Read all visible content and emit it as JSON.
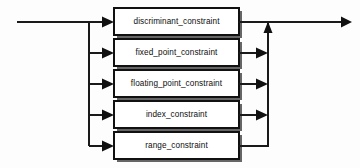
{
  "diagram": {
    "title": "constraint",
    "type": "railroad-syntax-diagram",
    "colors": {
      "background": "#fdfdfd",
      "line": "#1a1a1a",
      "box_fill": "#ffffff",
      "box_border": "#111111",
      "box_shadow": "#666666",
      "text": "#0d0d0d"
    },
    "entry": {
      "name": "entry-rail",
      "x1": 17,
      "x2": 89,
      "y": 22
    },
    "exit": {
      "name": "exit-rail",
      "x1": 268,
      "x2": 345,
      "y": 22
    },
    "left_bus": {
      "x": 89,
      "y1": 22,
      "y2": 146
    },
    "right_bus": {
      "x": 268,
      "y1": 22,
      "y2": 146
    },
    "alternatives": [
      {
        "label": "discriminant_constraint",
        "icon": "nonterminal-box",
        "row": 1,
        "box": {
          "x": 114,
          "y": 8,
          "w": 125,
          "h": 27
        },
        "in_arrow": true,
        "out_arrow": false
      },
      {
        "label": "fixed_point_constraint",
        "icon": "nonterminal-box",
        "row": 2,
        "box": {
          "x": 114,
          "y": 39,
          "w": 125,
          "h": 27
        },
        "in_arrow": true,
        "out_arrow": true
      },
      {
        "label": "floating_point_constraint",
        "icon": "nonterminal-box",
        "row": 3,
        "box": {
          "x": 114,
          "y": 70,
          "w": 125,
          "h": 27
        },
        "in_arrow": true,
        "out_arrow": true
      },
      {
        "label": "index_constraint",
        "icon": "nonterminal-box",
        "row": 4,
        "box": {
          "x": 114,
          "y": 101,
          "w": 125,
          "h": 27
        },
        "in_arrow": true,
        "out_arrow": true
      },
      {
        "label": "range_constraint",
        "icon": "nonterminal-box",
        "row": 5,
        "box": {
          "x": 114,
          "y": 132,
          "w": 125,
          "h": 27
        },
        "in_arrow": true,
        "out_arrow": false
      }
    ]
  }
}
